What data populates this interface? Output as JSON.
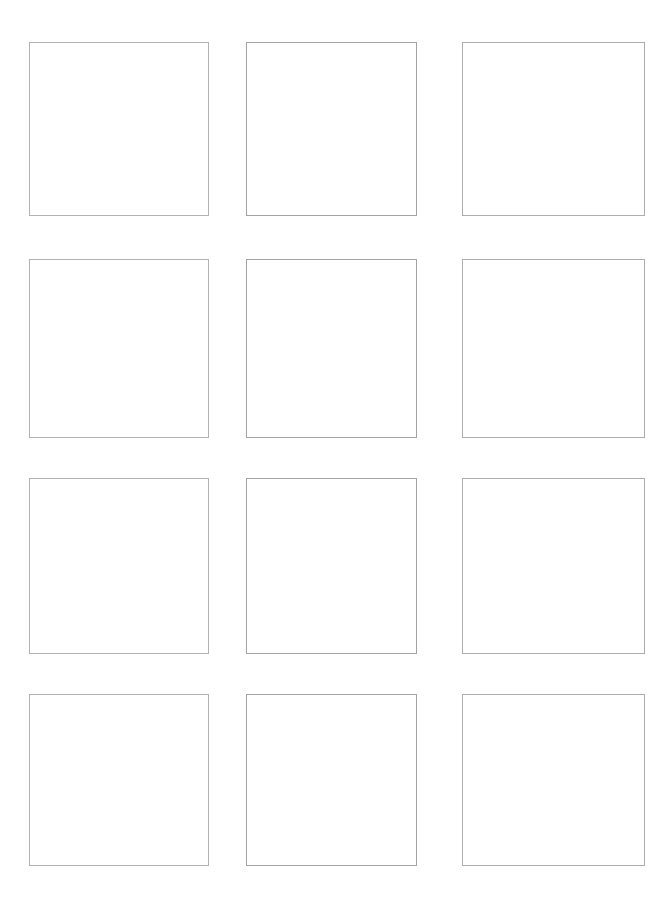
{
  "page": {
    "background_color": "#ffffff",
    "width": 671,
    "height": 908
  },
  "grid": {
    "columns": 3,
    "rows": 4,
    "total_cells": 12,
    "column_positions": [
      {
        "name": "column-1",
        "x": 29,
        "width": 180,
        "border_color": "#b2b2b2"
      },
      {
        "name": "column-2",
        "x": 246,
        "width": 171,
        "border_color": "#a3a3a3"
      },
      {
        "name": "column-3",
        "x": 462,
        "width": 183,
        "border_color": "#adadad"
      }
    ],
    "row_positions": [
      {
        "name": "row-1",
        "y": 42,
        "height": 174
      },
      {
        "name": "row-2",
        "y": 259,
        "height": 179
      },
      {
        "name": "row-3",
        "y": 478,
        "height": 176
      },
      {
        "name": "row-4",
        "y": 694,
        "height": 172
      }
    ],
    "cells": [
      {
        "id": "cell-r1c1",
        "row": 1,
        "column": 1,
        "content": ""
      },
      {
        "id": "cell-r1c2",
        "row": 1,
        "column": 2,
        "content": ""
      },
      {
        "id": "cell-r1c3",
        "row": 1,
        "column": 3,
        "content": ""
      },
      {
        "id": "cell-r2c1",
        "row": 2,
        "column": 1,
        "content": ""
      },
      {
        "id": "cell-r2c2",
        "row": 2,
        "column": 2,
        "content": ""
      },
      {
        "id": "cell-r2c3",
        "row": 2,
        "column": 3,
        "content": ""
      },
      {
        "id": "cell-r3c1",
        "row": 3,
        "column": 1,
        "content": ""
      },
      {
        "id": "cell-r3c2",
        "row": 3,
        "column": 2,
        "content": ""
      },
      {
        "id": "cell-r3c3",
        "row": 3,
        "column": 3,
        "content": ""
      },
      {
        "id": "cell-r4c1",
        "row": 4,
        "column": 1,
        "content": ""
      },
      {
        "id": "cell-r4c2",
        "row": 4,
        "column": 2,
        "content": ""
      },
      {
        "id": "cell-r4c3",
        "row": 4,
        "column": 3,
        "content": ""
      }
    ]
  },
  "colors": {
    "background": "#ffffff",
    "border_light": "#b2b2b2",
    "border_mid": "#a3a3a3",
    "border_light2": "#adadad"
  }
}
